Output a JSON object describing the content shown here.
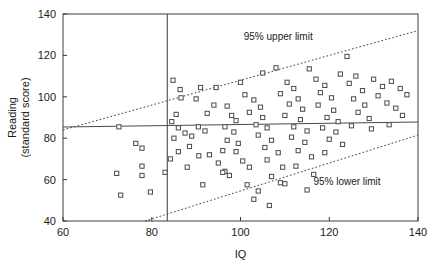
{
  "chart_data": {
    "type": "scatter",
    "title": "",
    "xlabel": "IQ",
    "ylabel": "Reading (standard score)",
    "ylabel_line1": "Reading",
    "ylabel_line2": "(standard score)",
    "xlim": [
      60,
      140
    ],
    "ylim": [
      40,
      140
    ],
    "xticks": [
      60,
      80,
      100,
      120,
      140
    ],
    "yticks": [
      40,
      60,
      80,
      100,
      120,
      140
    ],
    "xtick_labels": [
      "60",
      "80",
      "100",
      "120",
      "140"
    ],
    "ytick_labels": [
      "40",
      "60",
      "80",
      "100",
      "120",
      "140"
    ],
    "grid": false,
    "legend": "none",
    "marker_shape": "open-square",
    "annotations": [
      {
        "name": "upper-limit-label",
        "text": "95% upper limit",
        "x": 108.5,
        "y": 127.5
      },
      {
        "name": "lower-limit-label",
        "text": "95% lower limit",
        "x": 124.0,
        "y": 57.5
      }
    ],
    "reference_lines": [
      {
        "name": "regression-line",
        "style": "solid",
        "x1": 60,
        "y1": 85.4,
        "x2": 140,
        "y2": 87.8
      },
      {
        "name": "vertical-cutoff-line",
        "style": "solid",
        "x1": 83.5,
        "y1": 40,
        "x2": 83.5,
        "y2": 140
      },
      {
        "name": "upper-limit-line",
        "style": "dotted",
        "x1": 60,
        "y1": 84.0,
        "x2": 140,
        "y2": 132.0
      },
      {
        "name": "lower-limit-line",
        "style": "dotted",
        "x1": 78.5,
        "y1": 40.0,
        "x2": 140,
        "y2": 81.5
      }
    ],
    "points": [
      {
        "x": 72.6,
        "y": 85.5
      },
      {
        "x": 76.4,
        "y": 77.5
      },
      {
        "x": 77.8,
        "y": 75.2
      },
      {
        "x": 77.8,
        "y": 66.5
      },
      {
        "x": 72.1,
        "y": 63.0
      },
      {
        "x": 77.8,
        "y": 62.0
      },
      {
        "x": 73.0,
        "y": 52.5
      },
      {
        "x": 79.7,
        "y": 54.0
      },
      {
        "x": 86.4,
        "y": 103.5
      },
      {
        "x": 86.6,
        "y": 99.5
      },
      {
        "x": 90.0,
        "y": 99.0
      },
      {
        "x": 91.0,
        "y": 104.5
      },
      {
        "x": 92.5,
        "y": 92.0
      },
      {
        "x": 86.0,
        "y": 85.0
      },
      {
        "x": 87.5,
        "y": 82.5
      },
      {
        "x": 89.0,
        "y": 81.0
      },
      {
        "x": 90.5,
        "y": 85.5
      },
      {
        "x": 92.0,
        "y": 83.5
      },
      {
        "x": 88.5,
        "y": 76.0
      },
      {
        "x": 90.6,
        "y": 71.5
      },
      {
        "x": 93.0,
        "y": 72.0
      },
      {
        "x": 88.0,
        "y": 66.0
      },
      {
        "x": 95.0,
        "y": 68.0
      },
      {
        "x": 96.5,
        "y": 64.0
      },
      {
        "x": 91.5,
        "y": 57.5
      },
      {
        "x": 96.0,
        "y": 63.5
      },
      {
        "x": 94.0,
        "y": 96.0
      },
      {
        "x": 97.0,
        "y": 95.5
      },
      {
        "x": 98.0,
        "y": 91.0
      },
      {
        "x": 99.0,
        "y": 88.5
      },
      {
        "x": 96.5,
        "y": 85.5
      },
      {
        "x": 98.5,
        "y": 83.0
      },
      {
        "x": 97.0,
        "y": 79.0
      },
      {
        "x": 99.5,
        "y": 77.5
      },
      {
        "x": 96.0,
        "y": 74.0
      },
      {
        "x": 99.0,
        "y": 73.5
      },
      {
        "x": 100.5,
        "y": 69.0
      },
      {
        "x": 102.0,
        "y": 66.0
      },
      {
        "x": 97.5,
        "y": 62.0
      },
      {
        "x": 101.5,
        "y": 57.5
      },
      {
        "x": 104.0,
        "y": 54.5
      },
      {
        "x": 101.0,
        "y": 101.0
      },
      {
        "x": 103.0,
        "y": 98.5
      },
      {
        "x": 104.5,
        "y": 95.0
      },
      {
        "x": 102.0,
        "y": 92.5
      },
      {
        "x": 105.0,
        "y": 90.0
      },
      {
        "x": 103.5,
        "y": 86.5
      },
      {
        "x": 106.0,
        "y": 85.0
      },
      {
        "x": 104.0,
        "y": 81.5
      },
      {
        "x": 107.0,
        "y": 79.0
      },
      {
        "x": 105.5,
        "y": 75.5
      },
      {
        "x": 108.5,
        "y": 73.0
      },
      {
        "x": 106.0,
        "y": 69.5
      },
      {
        "x": 109.5,
        "y": 66.0
      },
      {
        "x": 107.0,
        "y": 61.5
      },
      {
        "x": 110.0,
        "y": 58.0
      },
      {
        "x": 108.0,
        "y": 114.0
      },
      {
        "x": 110.5,
        "y": 107.0
      },
      {
        "x": 112.0,
        "y": 104.0
      },
      {
        "x": 109.0,
        "y": 101.5
      },
      {
        "x": 113.0,
        "y": 99.0
      },
      {
        "x": 111.0,
        "y": 96.5
      },
      {
        "x": 114.0,
        "y": 94.0
      },
      {
        "x": 110.0,
        "y": 91.0
      },
      {
        "x": 113.5,
        "y": 89.0
      },
      {
        "x": 112.0,
        "y": 85.5
      },
      {
        "x": 115.0,
        "y": 83.5
      },
      {
        "x": 111.5,
        "y": 80.5
      },
      {
        "x": 114.5,
        "y": 78.0
      },
      {
        "x": 113.0,
        "y": 74.0
      },
      {
        "x": 116.0,
        "y": 71.0
      },
      {
        "x": 112.5,
        "y": 66.5
      },
      {
        "x": 116.5,
        "y": 62.5
      },
      {
        "x": 117.0,
        "y": 108.5
      },
      {
        "x": 119.0,
        "y": 105.5
      },
      {
        "x": 118.0,
        "y": 102.0
      },
      {
        "x": 120.5,
        "y": 99.5
      },
      {
        "x": 117.5,
        "y": 96.0
      },
      {
        "x": 121.0,
        "y": 93.5
      },
      {
        "x": 119.5,
        "y": 90.0
      },
      {
        "x": 122.0,
        "y": 88.0
      },
      {
        "x": 118.5,
        "y": 85.0
      },
      {
        "x": 121.5,
        "y": 83.0
      },
      {
        "x": 120.0,
        "y": 79.5
      },
      {
        "x": 123.0,
        "y": 77.0
      },
      {
        "x": 119.0,
        "y": 73.0
      },
      {
        "x": 124.0,
        "y": 119.5
      },
      {
        "x": 126.0,
        "y": 110.0
      },
      {
        "x": 124.5,
        "y": 106.5
      },
      {
        "x": 127.5,
        "y": 103.0
      },
      {
        "x": 125.5,
        "y": 99.0
      },
      {
        "x": 128.0,
        "y": 96.0
      },
      {
        "x": 126.5,
        "y": 92.5
      },
      {
        "x": 129.0,
        "y": 89.5
      },
      {
        "x": 125.0,
        "y": 86.0
      },
      {
        "x": 130.0,
        "y": 108.5
      },
      {
        "x": 132.0,
        "y": 105.0
      },
      {
        "x": 131.0,
        "y": 100.5
      },
      {
        "x": 134.0,
        "y": 107.5
      },
      {
        "x": 133.0,
        "y": 97.0
      },
      {
        "x": 136.0,
        "y": 104.0
      },
      {
        "x": 135.0,
        "y": 94.5
      },
      {
        "x": 137.5,
        "y": 101.0
      },
      {
        "x": 129.5,
        "y": 84.5
      },
      {
        "x": 133.5,
        "y": 86.5
      },
      {
        "x": 136.5,
        "y": 91.0
      },
      {
        "x": 84.8,
        "y": 108.0
      },
      {
        "x": 85.5,
        "y": 91.5
      },
      {
        "x": 84.5,
        "y": 88.0
      },
      {
        "x": 85.0,
        "y": 80.0
      },
      {
        "x": 86.0,
        "y": 73.5
      },
      {
        "x": 84.2,
        "y": 70.0
      },
      {
        "x": 83.0,
        "y": 63.5
      },
      {
        "x": 94.5,
        "y": 104.5
      },
      {
        "x": 100.0,
        "y": 107.0
      },
      {
        "x": 105.0,
        "y": 111.5
      },
      {
        "x": 115.5,
        "y": 113.5
      },
      {
        "x": 122.5,
        "y": 111.0
      },
      {
        "x": 109.0,
        "y": 58.5
      },
      {
        "x": 115.0,
        "y": 55.0
      },
      {
        "x": 103.0,
        "y": 50.5
      },
      {
        "x": 106.5,
        "y": 47.5
      }
    ]
  }
}
